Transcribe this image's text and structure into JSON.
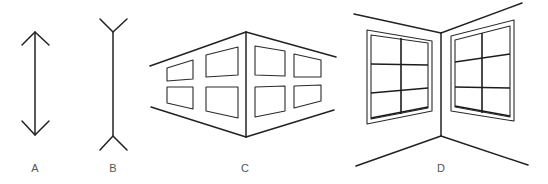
{
  "figure": {
    "panels": [
      {
        "id": "A",
        "label": "A",
        "content": "vertical line with outward-pointing arrowheads (fins inward)"
      },
      {
        "id": "B",
        "label": "B",
        "content": "vertical line with outward-splayed fins (Y-ends)"
      },
      {
        "id": "C",
        "label": "C",
        "content": "outside corner of a building, seen from outside, with 8 windows"
      },
      {
        "id": "D",
        "label": "D",
        "content": "inside corner of a room, with two six-pane windows"
      }
    ],
    "colors": {
      "line": "#222222",
      "label": "#555555",
      "background": "#ffffff"
    }
  }
}
